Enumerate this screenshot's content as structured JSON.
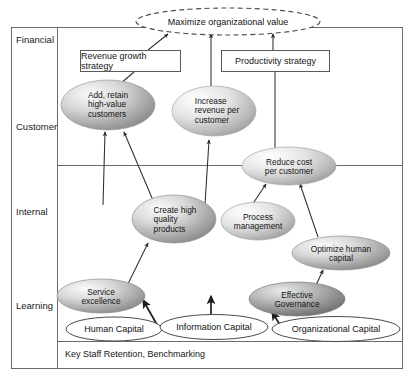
{
  "diagram": {
    "perspectives": [
      {
        "label": "Financial"
      },
      {
        "label": "Customer"
      },
      {
        "label": "Internal"
      },
      {
        "label": "Learning"
      }
    ],
    "goal": {
      "label": "Maximize organizational value",
      "style": "dashed-ellipse"
    },
    "strategy_boxes": [
      {
        "label": "Revenue growth strategy"
      },
      {
        "label": "Productivity strategy"
      }
    ],
    "objectives": [
      {
        "id": "add-retain",
        "label": "Add, retain high-value customers",
        "lines": [
          "Add, retain",
          "high-value",
          "customers"
        ],
        "perspective": "Customer"
      },
      {
        "id": "increase-revenue",
        "label": "Increase revenue per customer",
        "lines": [
          "Increase",
          "revenue per",
          "customer"
        ],
        "perspective": "Customer"
      },
      {
        "id": "reduce-cost",
        "label": "Reduce cost per customer",
        "lines": [
          "Reduce cost",
          "per customer"
        ],
        "perspective": "Customer"
      },
      {
        "id": "create-quality",
        "label": "Create high quality products",
        "lines": [
          "Create high",
          "quality",
          "products"
        ],
        "perspective": "Internal"
      },
      {
        "id": "process-mgmt",
        "label": "Process management",
        "lines": [
          "Process",
          "management"
        ],
        "perspective": "Internal"
      },
      {
        "id": "optimize-human",
        "label": "Optimize human capital",
        "lines": [
          "Optimize human",
          "capital"
        ],
        "perspective": "Internal"
      },
      {
        "id": "service-excellence",
        "label": "Service excellence",
        "lines": [
          "Service",
          "excellence"
        ],
        "perspective": "Learning"
      },
      {
        "id": "effective-governance",
        "label": "Effective Governance",
        "lines": [
          "Effective",
          "Governance"
        ],
        "perspective": "Learning"
      }
    ],
    "enablers": [
      {
        "id": "human-capital",
        "label": "Human Capital"
      },
      {
        "id": "information-capital",
        "label": "Information Capital"
      },
      {
        "id": "organizational-capital",
        "label": "Organizational Capital"
      }
    ],
    "footer": {
      "label": "Key Staff Retention, Benchmarking"
    },
    "colors": {
      "frame": "#6b6b6b",
      "line": "#3a3a3a",
      "ellipse_light": "#f2f2f2",
      "ellipse_mid": "#b9b9b9",
      "ellipse_dark": "#8a8a8a",
      "text": "#141414"
    }
  }
}
